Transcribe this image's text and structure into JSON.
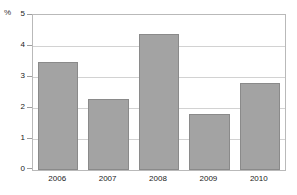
{
  "chart_data": {
    "type": "bar",
    "title": "",
    "xlabel": "",
    "ylabel": "%",
    "unit_label": "%",
    "categories": [
      "2006",
      "2007",
      "2008",
      "2009",
      "2010"
    ],
    "values": [
      3.5,
      2.3,
      4.4,
      1.8,
      2.8
    ],
    "series": [
      {
        "name": "",
        "values": [
          3.5,
          2.3,
          4.4,
          1.8,
          2.8
        ]
      }
    ],
    "ylim": [
      0,
      5
    ],
    "xlim_categories": 5,
    "yticks": [
      0,
      1,
      2,
      3,
      4,
      5
    ],
    "ytick_labels": [
      "0",
      "1",
      "2",
      "3",
      "4",
      "5"
    ],
    "grid": true,
    "grid_axis": "y",
    "legend": false,
    "legend_position": "none",
    "colors": {
      "bar_fill": "#a3a3a3",
      "bar_border": "#8a8a8a",
      "gridline": "#d2d2d2",
      "axis_frame": "#b9b9b9",
      "text": "#222222",
      "background": "#ffffff"
    }
  }
}
